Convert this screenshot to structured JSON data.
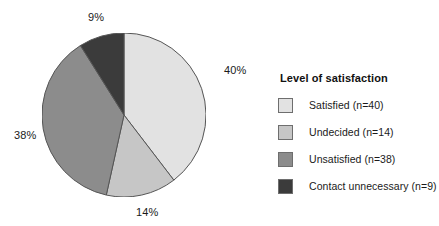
{
  "chart_data": {
    "type": "pie",
    "title": "",
    "legend_title": "Level of satisfaction",
    "legend_position": "right",
    "total": 101,
    "start_angle_deg": 0,
    "direction": "clockwise",
    "categories": [
      "Satisfied",
      "Undecided",
      "Unsatisfied",
      "Contact unnecessary"
    ],
    "values": [
      40,
      14,
      38,
      9
    ],
    "percentages": [
      40,
      14,
      38,
      9
    ],
    "slices": [
      {
        "name": "Satisfied",
        "legend_label": "Satisfied (n=40)",
        "count": 40,
        "percent": 40,
        "percent_label": "40%",
        "color": "#e2e2e2"
      },
      {
        "name": "Undecided",
        "legend_label": "Undecided (n=14)",
        "count": 14,
        "percent": 14,
        "percent_label": "14%",
        "color": "#c6c6c6"
      },
      {
        "name": "Unsatisfied",
        "legend_label": "Unsatisfied (n=38)",
        "count": 38,
        "percent": 38,
        "percent_label": "38%",
        "color": "#8c8c8c"
      },
      {
        "name": "Contact unnecessary",
        "legend_label": "Contact unnecessary (n=9)",
        "count": 9,
        "percent": 9,
        "percent_label": "9%",
        "color": "#3b3b3b"
      }
    ],
    "outline_color": "#555555"
  }
}
